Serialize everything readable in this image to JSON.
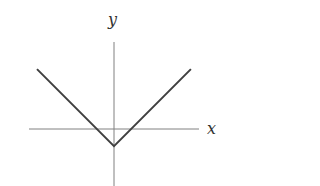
{
  "chart_data": {
    "type": "line",
    "title": "",
    "xlabel": "x",
    "ylabel": "y",
    "function": "y = |x| - 1",
    "series": [
      {
        "name": "V-shaped graph",
        "points": [
          [
            -4.5,
            3.5
          ],
          [
            0,
            -1
          ],
          [
            4.5,
            3.5
          ]
        ]
      }
    ],
    "vertex": [
      0,
      -1
    ],
    "x_intercepts": [
      -1,
      1
    ],
    "grid": false,
    "ticks": false,
    "legend": "none",
    "style": {
      "axis_color": "#808080",
      "line_color": "#404040",
      "label_color": "#333333"
    }
  },
  "labels": {
    "x_axis": "x",
    "y_axis": "y"
  }
}
